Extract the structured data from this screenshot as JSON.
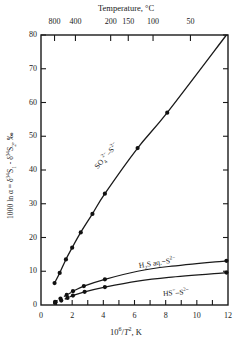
{
  "chart_data": {
    "type": "line",
    "title": "",
    "xlabel": "10⁶/T², K",
    "ylabel": "1000 ln α = δ³⁴S₁ - δ³⁴S₂, ‰",
    "top_axis_label": "Temperature, °C",
    "xlim": [
      0,
      12
    ],
    "ylim": [
      0,
      80
    ],
    "grid": false,
    "legend": "inline-series-labels",
    "x_ticks": [
      0,
      1,
      2,
      3,
      4,
      5,
      6,
      7,
      8,
      9,
      10,
      11,
      12
    ],
    "x_tick_labels": [
      "0",
      "",
      "2",
      "",
      "4",
      "",
      "6",
      "",
      "8",
      "",
      "10",
      "",
      "12"
    ],
    "y_ticks": [
      0,
      10,
      20,
      30,
      40,
      50,
      60,
      70,
      80
    ],
    "y_tick_labels": [
      "0",
      "10",
      "20",
      "30",
      "40",
      "50",
      "60",
      "70",
      "80"
    ],
    "top_ticks": [
      {
        "label": "800",
        "x": 0.868
      },
      {
        "label": "400",
        "x": 2.21
      },
      {
        "label": "200",
        "x": 4.47
      },
      {
        "label": "150",
        "x": 5.6
      },
      {
        "label": "100",
        "x": 7.19
      },
      {
        "label": "50",
        "x": 9.59
      }
    ],
    "series": [
      {
        "name": "SO₄²⁻ - S²⁻",
        "label": "SO₄²⁻–S²⁻",
        "style": "solid",
        "marker": "filled-circle",
        "x": [
          0.87,
          1.2,
          1.6,
          2.0,
          2.55,
          3.3,
          4.1,
          6.2,
          8.1,
          11.9
        ],
        "y": [
          6.5,
          9.5,
          13.5,
          17.0,
          21.5,
          27.0,
          33.0,
          46.5,
          57.0,
          80.0
        ],
        "marker_points": [
          {
            "x": 0.87,
            "y": 6.5
          },
          {
            "x": 1.2,
            "y": 9.5
          },
          {
            "x": 1.6,
            "y": 13.5
          },
          {
            "x": 2.0,
            "y": 17.0
          },
          {
            "x": 2.55,
            "y": 21.5
          },
          {
            "x": 3.3,
            "y": 27.0
          },
          {
            "x": 4.1,
            "y": 33.0
          },
          {
            "x": 6.2,
            "y": 46.5
          },
          {
            "x": 8.1,
            "y": 57.0
          }
        ]
      },
      {
        "name": "H₂S aq. - S²⁻",
        "label": "H₂S aq.–S²⁻",
        "style": "solid-with-dashed-tail",
        "marker": "filled-circle",
        "x": [
          0.9,
          1.25,
          1.65,
          2.0,
          2.1,
          2.75,
          4.1,
          6.2,
          8.2,
          11.9
        ],
        "y": [
          0.9,
          1.9,
          3.0,
          3.9,
          4.2,
          5.6,
          7.6,
          10.0,
          11.4,
          13.1
        ],
        "marker_points": [
          {
            "x": 0.9,
            "y": 0.9
          },
          {
            "x": 1.25,
            "y": 1.9
          },
          {
            "x": 1.65,
            "y": 3.0
          },
          {
            "x": 2.05,
            "y": 4.1
          },
          {
            "x": 2.75,
            "y": 5.6
          },
          {
            "x": 4.1,
            "y": 7.6
          },
          {
            "x": 11.9,
            "y": 13.1
          }
        ],
        "dashed_range_x": [
          0.9,
          2.1
        ]
      },
      {
        "name": "HS⁻ - S²⁻",
        "label": "HS⁻–S²⁻",
        "style": "solid-with-dashed-tail",
        "marker": "filled-circle",
        "x": [
          0.9,
          1.3,
          1.7,
          2.05,
          2.1,
          2.8,
          4.1,
          6.2,
          8.2,
          11.9
        ],
        "y": [
          0.6,
          1.3,
          2.1,
          2.8,
          2.9,
          3.9,
          5.3,
          7.1,
          8.2,
          9.6
        ],
        "marker_points": [
          {
            "x": 0.9,
            "y": 0.6
          },
          {
            "x": 1.3,
            "y": 1.3
          },
          {
            "x": 1.7,
            "y": 2.1
          },
          {
            "x": 2.05,
            "y": 2.8
          },
          {
            "x": 2.8,
            "y": 3.9
          },
          {
            "x": 4.1,
            "y": 5.3
          },
          {
            "x": 11.9,
            "y": 9.6
          }
        ],
        "dashed_range_x": [
          0.9,
          2.1
        ]
      }
    ]
  },
  "axes": {
    "top_title": "Temperature, °C",
    "left_title_html": "1000 ln α = δ³⁴S₁ - δ³⁴S₂, ‰",
    "bottom_title": "10⁶/T², K"
  },
  "labels": {
    "series_so4": "SO₄²⁻–S²⁻",
    "series_h2s": "H₂S aq.–S²⁻",
    "series_hs": "HS⁻–S²⁻"
  }
}
